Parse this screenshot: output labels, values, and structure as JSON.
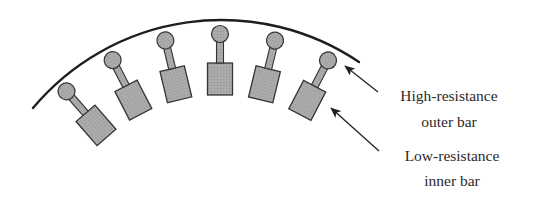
{
  "figure": {
    "type": "rotor-cross-section-double-cage",
    "colors": {
      "outline": "#222222",
      "bar_fill": "#a9a9a9",
      "background": "#ffffff"
    },
    "bars_count": 6,
    "bar_angles_deg": [
      -41,
      -27.3,
      -13.5,
      0,
      13.6,
      27.5
    ]
  },
  "labels": {
    "outer_bar": {
      "line1": "High-resistance",
      "line2": "outer bar"
    },
    "inner_bar": {
      "line1": "Low-resistance",
      "line2": "inner bar"
    }
  }
}
